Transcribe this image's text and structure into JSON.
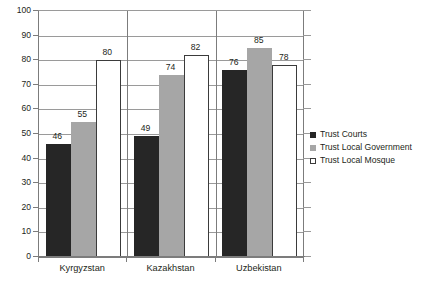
{
  "chart_data": {
    "type": "bar",
    "title": "",
    "subtitle": "",
    "xlabel": "",
    "ylabel": "",
    "ylim": [
      0,
      100
    ],
    "ytick_step": 10,
    "yticks": [
      100,
      90,
      80,
      70,
      60,
      50,
      40,
      30,
      20,
      10,
      0
    ],
    "grid": true,
    "legend_position": "right",
    "categories": [
      "Kyrgyzstan",
      "Kazakhstan",
      "Uzbekistan"
    ],
    "series": [
      {
        "name": "Trust Courts",
        "color": "#262626",
        "values": [
          46,
          49,
          76
        ]
      },
      {
        "name": "Trust Local Government",
        "color": "#a6a6a6",
        "values": [
          55,
          74,
          85
        ]
      },
      {
        "name": "Trust Local Mosque",
        "color": "#ffffff",
        "border_color": "#3b3b3b",
        "values": [
          80,
          82,
          78
        ]
      }
    ],
    "data_labels": [
      [
        46,
        55,
        80
      ],
      [
        49,
        74,
        82
      ],
      [
        76,
        85,
        78
      ]
    ]
  },
  "axis": {
    "grid_color": "#9a9a9a",
    "axis_color": "#7c7c7c",
    "text_color": "#231f20"
  }
}
